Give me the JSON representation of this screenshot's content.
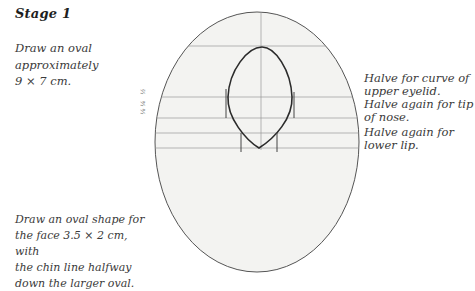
{
  "heading": "Stage 1",
  "captions": {
    "top": [
      "Draw an oval",
      "approximately",
      "9 × 7 cm."
    ],
    "bottom": [
      "Draw an oval shape for",
      "the face 3.5 × 2 cm, with",
      "the chin line halfway",
      "down the larger oval."
    ]
  },
  "notes": [
    {
      "lines": [
        "Halve for curve of",
        "upper eyelid."
      ]
    },
    {
      "lines": [
        "Halve again for tip",
        "of nose."
      ]
    },
    {
      "lines": [
        "Halve again for",
        "lower lip."
      ]
    }
  ],
  "fraction_marks": [
    "½",
    "¼",
    "⅛"
  ],
  "colors": {
    "outline": "#555555",
    "inner_outline": "#2b2b2b",
    "guide": "#9a9a9a",
    "paper_fill": "#f3f3f1"
  }
}
